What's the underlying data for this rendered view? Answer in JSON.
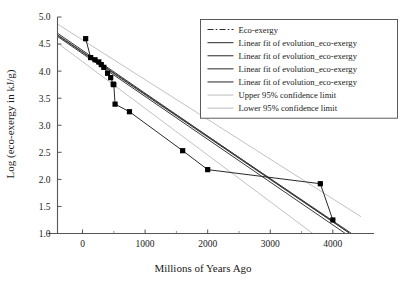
{
  "chart_data": {
    "type": "line",
    "title": "",
    "xlabel": "Millions of Years Ago",
    "ylabel": "Log (eco-exergy in kJ/g)",
    "xlim": [
      -400,
      4450
    ],
    "ylim": [
      1.0,
      5.0
    ],
    "grid": false,
    "legend_position": "top-right",
    "xticks": [
      0,
      1000,
      2000,
      3000,
      4000
    ],
    "xtick_labels": [
      "0",
      "1000",
      "2000",
      "3000",
      "4000"
    ],
    "xminor_ticks": [
      500,
      1500,
      2500,
      3500
    ],
    "yticks": [
      1.0,
      1.5,
      2.0,
      2.5,
      3.0,
      3.5,
      4.0,
      4.5,
      5.0
    ],
    "ytick_labels": [
      "1.0",
      "1.5",
      "2.0",
      "2.5",
      "3.0",
      "3.5",
      "4.0",
      "4.5",
      "5.0"
    ],
    "series": [
      {
        "name": "Eco-exergy",
        "style": "dash-dot-markers",
        "color": "#2a2a2a",
        "x": [
          50,
          130,
          200,
          260,
          300,
          340,
          400,
          450,
          490,
          500,
          520,
          750,
          1600,
          2000,
          3800,
          4000
        ],
        "y": [
          4.6,
          4.25,
          4.21,
          4.17,
          4.12,
          4.07,
          3.96,
          3.88,
          3.76,
          3.75,
          3.39,
          3.25,
          2.53,
          2.18,
          1.92,
          1.25
        ]
      },
      {
        "name": "Linear fit of evolution_eco-exergy",
        "style": "solid",
        "color": "#3a3a3a",
        "x": [
          -400,
          4300
        ],
        "y": [
          4.67,
          1.0
        ]
      },
      {
        "name": "Linear fit of evolution_eco-exergy",
        "style": "solid",
        "color": "#3a3a3a",
        "x": [
          -400,
          4200
        ],
        "y": [
          4.64,
          1.0
        ]
      },
      {
        "name": "Linear fit of evolution_eco-exergy",
        "style": "solid",
        "color": "#3a3a3a",
        "x": [
          -400,
          4250
        ],
        "y": [
          4.7,
          1.02
        ]
      },
      {
        "name": "Linear fit of evolution_eco-exergy",
        "style": "solid",
        "color": "#3a3a3a",
        "x": [
          -400,
          4260
        ],
        "y": [
          4.66,
          1.01
        ]
      },
      {
        "name": "Upper 95% confidence limit",
        "style": "solid",
        "color": "#c2c2c2",
        "x": [
          -400,
          4450
        ],
        "y": [
          4.87,
          1.31
        ]
      },
      {
        "name": "Lower 95% confidence limit",
        "style": "solid",
        "color": "#c2c2c2",
        "x": [
          -400,
          3680
        ],
        "y": [
          4.52,
          1.0
        ]
      }
    ],
    "legend_entries": [
      {
        "label": "Eco-exergy",
        "style": "dash-dot-markers",
        "color": "#2a2a2a"
      },
      {
        "label": "Linear fit of evolution_eco-exergy",
        "style": "solid",
        "color": "#3a3a3a"
      },
      {
        "label": "Linear fit of evolution_eco-exergy",
        "style": "solid",
        "color": "#3a3a3a"
      },
      {
        "label": "Linear fit of evolution_eco-exergy",
        "style": "solid",
        "color": "#3a3a3a"
      },
      {
        "label": "Linear fit of evolution_eco-exergy",
        "style": "solid",
        "color": "#3a3a3a"
      },
      {
        "label": "Upper 95% confidence limit",
        "style": "solid",
        "color": "#c2c2c2"
      },
      {
        "label": "Lower 95% confidence limit",
        "style": "solid",
        "color": "#c2c2c2"
      }
    ],
    "colors": {
      "background": "#ffffff",
      "axis": "#555555",
      "series_primary": "#2a2a2a",
      "fit": "#3a3a3a",
      "confidence": "#c2c2c2",
      "text": "#1a1a1a",
      "legend_border": "#4a4a4a"
    }
  }
}
